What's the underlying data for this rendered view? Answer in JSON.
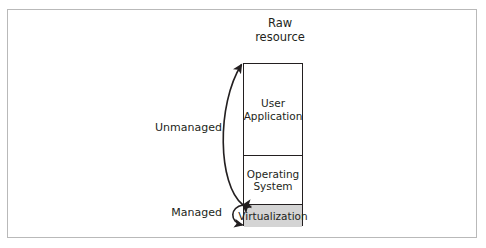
{
  "figure": {
    "title": {
      "line1": "Raw",
      "line2": "resource"
    },
    "stack": {
      "layers": [
        {
          "name": "user-application",
          "line1": "User",
          "line2": "Application",
          "filled": false
        },
        {
          "name": "operating-system",
          "line1": "Operating",
          "line2": "System",
          "filled": false
        },
        {
          "name": "virtualization",
          "line1": "Virtualization",
          "line2": "",
          "filled": true
        }
      ]
    },
    "annotations": [
      {
        "name": "unmanaged",
        "label": "Unmanaged"
      },
      {
        "name": "managed",
        "label": "Managed"
      }
    ],
    "colors": {
      "ink": "#231f20",
      "frame": "#b9b9b9",
      "shaded_layer_fill": "#d4d4d4",
      "background": "#ffffff"
    }
  }
}
